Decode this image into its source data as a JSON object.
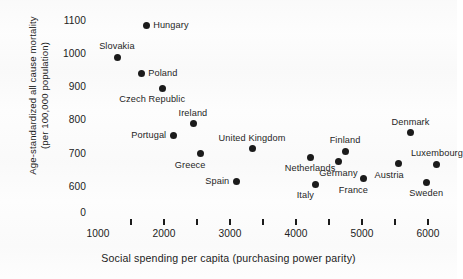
{
  "chart_data": {
    "type": "scatter",
    "title": "",
    "xlabel": "Social spending per capita (purchasing power parity)",
    "ylabel_line1": "Age-standardized all cause mortality",
    "ylabel_line2": "(per 100,000 population)",
    "xlim": [
      850,
      6500
    ],
    "ylim": [
      570,
      1130
    ],
    "grid": false,
    "legend": "none",
    "xticks_major": [
      1000,
      2000,
      3000,
      4000,
      5000,
      6000
    ],
    "xtick_labels": [
      "1000",
      "2000",
      "3000",
      "4000",
      "5000",
      "6000"
    ],
    "xticks_all": [
      1500,
      2000,
      2500,
      3000,
      3500,
      4000,
      4500,
      5000,
      5500,
      6000
    ],
    "yticks": [
      0,
      600,
      700,
      800,
      900,
      1000,
      1100
    ],
    "ytick_labels": [
      "0",
      "600",
      "700",
      "800",
      "900",
      "1000",
      "1100"
    ],
    "marker_color": "#1b1b1b",
    "points": [
      {
        "country": "Hungary",
        "x": 1730,
        "y": 1085,
        "label_pos": "right"
      },
      {
        "country": "Slovakia",
        "x": 1290,
        "y": 990,
        "label_pos": "above"
      },
      {
        "country": "Poland",
        "x": 1655,
        "y": 940,
        "label_pos": "right"
      },
      {
        "country": "Czech Republic",
        "x": 1975,
        "y": 897,
        "label_pos": "below-left"
      },
      {
        "country": "Ireland",
        "x": 2440,
        "y": 790,
        "label_pos": "above"
      },
      {
        "country": "Portugal",
        "x": 2140,
        "y": 755,
        "label_pos": "left"
      },
      {
        "country": "Greece",
        "x": 2550,
        "y": 700,
        "label_pos": "below-left"
      },
      {
        "country": "United Kingdom",
        "x": 3335,
        "y": 715,
        "label_pos": "above"
      },
      {
        "country": "Spain",
        "x": 3095,
        "y": 618,
        "label_pos": "left"
      },
      {
        "country": "Netherlands",
        "x": 4215,
        "y": 690,
        "label_pos": "below"
      },
      {
        "country": "Germany",
        "x": 4640,
        "y": 676,
        "label_pos": "below"
      },
      {
        "country": "Finland",
        "x": 4745,
        "y": 708,
        "label_pos": "above"
      },
      {
        "country": "Italy",
        "x": 4290,
        "y": 608,
        "label_pos": "below-left"
      },
      {
        "country": "France",
        "x": 5020,
        "y": 625,
        "label_pos": "below-left"
      },
      {
        "country": "Denmark",
        "x": 5735,
        "y": 763,
        "label_pos": "above"
      },
      {
        "country": "Austria",
        "x": 5560,
        "y": 670,
        "label_pos": "below-left"
      },
      {
        "country": "Luxembourg",
        "x": 6135,
        "y": 668,
        "label_pos": "above"
      },
      {
        "country": "Sweden",
        "x": 5975,
        "y": 615,
        "label_pos": "below"
      }
    ]
  }
}
